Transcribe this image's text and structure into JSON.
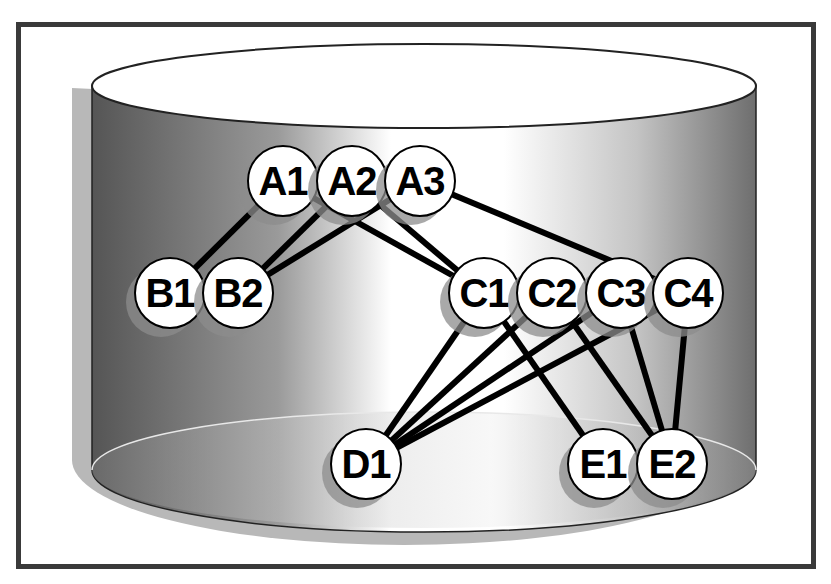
{
  "diagram": {
    "title": "",
    "container": {
      "shape": "cylinder",
      "colors": {
        "dark": "#5a5a5a",
        "light": "#ffffff",
        "shadow": "#b5b5b5",
        "frame": "#3a3a3a"
      }
    },
    "nodes": [
      {
        "id": "A1",
        "label": "A1",
        "x": 283,
        "y": 181
      },
      {
        "id": "A2",
        "label": "A2",
        "x": 352,
        "y": 181
      },
      {
        "id": "A3",
        "label": "A3",
        "x": 420,
        "y": 181
      },
      {
        "id": "B1",
        "label": "B1",
        "x": 170,
        "y": 293
      },
      {
        "id": "B2",
        "label": "B2",
        "x": 238,
        "y": 293
      },
      {
        "id": "C1",
        "label": "C1",
        "x": 484,
        "y": 293
      },
      {
        "id": "C2",
        "label": "C2",
        "x": 552,
        "y": 293
      },
      {
        "id": "C3",
        "label": "C3",
        "x": 621,
        "y": 293
      },
      {
        "id": "C4",
        "label": "C4",
        "x": 688,
        "y": 293
      },
      {
        "id": "D1",
        "label": "D1",
        "x": 366,
        "y": 464
      },
      {
        "id": "E1",
        "label": "E1",
        "x": 603,
        "y": 464
      },
      {
        "id": "E2",
        "label": "E2",
        "x": 672,
        "y": 464
      }
    ],
    "edges": [
      {
        "from": "A1",
        "to": "B1"
      },
      {
        "from": "A2",
        "to": "B2"
      },
      {
        "from": "A3",
        "to": "B2"
      },
      {
        "from": "A1",
        "to": "C1"
      },
      {
        "from": "A2",
        "to": "C1"
      },
      {
        "from": "A3",
        "to": "C4"
      },
      {
        "from": "C1",
        "to": "D1"
      },
      {
        "from": "C2",
        "to": "D1"
      },
      {
        "from": "C3",
        "to": "D1"
      },
      {
        "from": "C4",
        "to": "D1"
      },
      {
        "from": "C1",
        "to": "E1"
      },
      {
        "from": "C2",
        "to": "E2"
      },
      {
        "from": "C3",
        "to": "E2"
      },
      {
        "from": "C4",
        "to": "E2"
      }
    ]
  }
}
